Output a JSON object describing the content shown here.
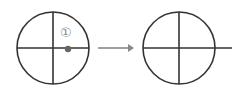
{
  "diagram": {
    "before": {
      "label": "①",
      "marker": "point-on-horizontal-axis"
    },
    "transition": "arrow-right",
    "after": {
      "description": "horizontal axis extended beyond circle"
    },
    "colors": {
      "stroke": "#333333",
      "marker": "#666666",
      "label": "#8a8a8a",
      "arrow": "#888888"
    }
  }
}
